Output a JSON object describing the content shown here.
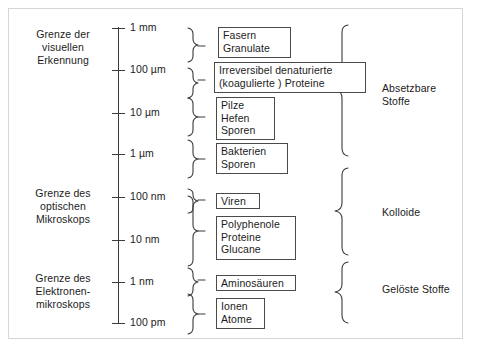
{
  "diagram": {
    "left_annotations": [
      {
        "id": "visual",
        "text": "Grenze der\nvisuellen\nErkennung"
      },
      {
        "id": "optical",
        "text": "Grenze des\noptischen\nMikroskops"
      },
      {
        "id": "electron",
        "text": "Grenze des\nElektronen-\nmikroskops"
      }
    ],
    "axis": {
      "ticks": [
        {
          "label": "1 mm",
          "y": 28
        },
        {
          "label": "100 µm",
          "y": 70
        },
        {
          "label": "10 µm",
          "y": 113
        },
        {
          "label": "1 µm",
          "y": 154
        },
        {
          "label": "100 nm",
          "y": 197
        },
        {
          "label": "10 nm",
          "y": 240
        },
        {
          "label": "1 nm",
          "y": 282
        },
        {
          "label": "100 pm",
          "y": 323
        }
      ]
    },
    "items": [
      {
        "id": "fasern",
        "text": "Fasern\nGranulate"
      },
      {
        "id": "proteine-denat",
        "text": "Irreversibel denaturierte\n(koagulierte ) Proteine"
      },
      {
        "id": "pilze",
        "text": "Pilze\nHefen\nSporen"
      },
      {
        "id": "bakterien",
        "text": "Bakterien\nSporen"
      },
      {
        "id": "viren",
        "text": "Viren"
      },
      {
        "id": "polyphenole",
        "text": "Polyphenole\nProteine\nGlucane"
      },
      {
        "id": "aminosaeuren",
        "text": "Aminosäuren"
      },
      {
        "id": "ionen",
        "text": "Ionen\nAtome"
      }
    ],
    "categories": [
      {
        "id": "absetzbare",
        "text": "Absetzbare\nStoffe"
      },
      {
        "id": "kolloide",
        "text": "Kolloide"
      },
      {
        "id": "geloeste",
        "text": "Gelöste Stoffe"
      }
    ],
    "colors": {
      "ink": "#1b1b1b",
      "line": "#3a3a3a",
      "box_border": "#4a4a4a",
      "frame": "#d6d6d6",
      "background": "#ffffff"
    }
  }
}
